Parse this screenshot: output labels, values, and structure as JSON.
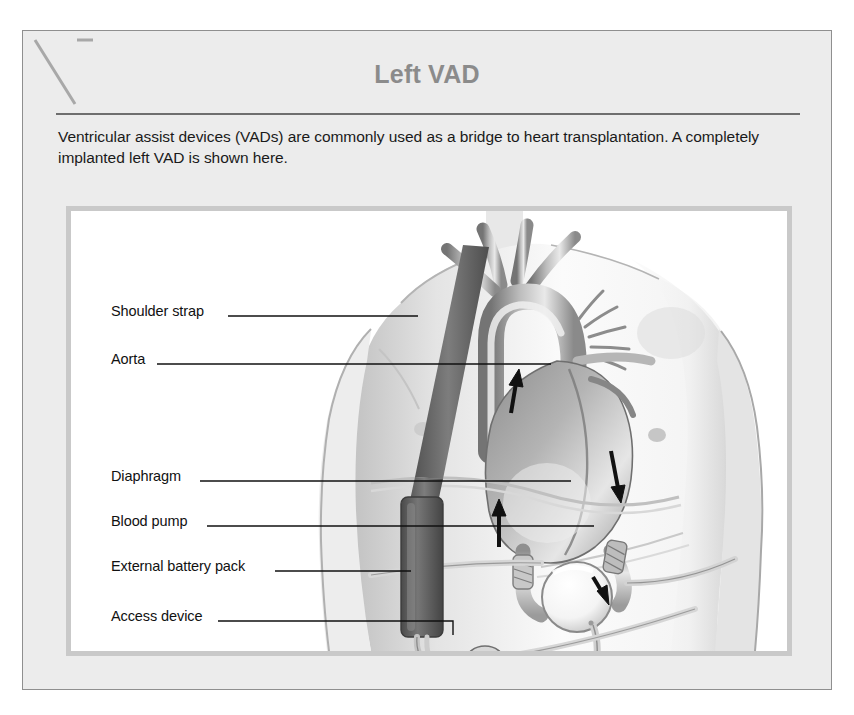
{
  "figure": {
    "title": "Left VAD",
    "caption": "Ventricular assist devices (VADs) are commonly used as a bridge to heart transplantation. A completely implanted left VAD is shown here.",
    "corner_mark": "diagonal-slash-mark"
  },
  "colors": {
    "card_background": "#ececec",
    "card_border": "#8f8f8f",
    "title_text": "#8b8b8b",
    "title_rule": "#6e6e6e",
    "caption_text": "#1a1a1a",
    "panel_background": "#ffffff",
    "panel_border": "#c9c9c9",
    "leader_line": "#111111",
    "label_text": "#111111",
    "strap_dark": "#6a6a6a",
    "battery_dark": "#5e5e5e",
    "skin_light": "#f3f3f3",
    "skin_shade": "#cfcfcf",
    "heart_mid": "#9a9a9a",
    "heart_dark": "#6d6d6d",
    "arrow_black": "#111111",
    "pump_white": "#fbfbfb",
    "tube_gray": "#b5b5b5"
  },
  "illustration": {
    "subject": "male-torso-anterior-view-with-implanted-left-ventricular-assist-device",
    "anatomy": [
      "aortic-arch",
      "brachiocephalic-branches",
      "ascending-aorta",
      "heart-left-ventricle",
      "pulmonary-artery",
      "diaphragm"
    ],
    "device_parts": [
      "shoulder-strap",
      "external-battery-pack",
      "blood-pump",
      "inflow-cannula",
      "outflow-cannula",
      "driveline",
      "access-device-port"
    ],
    "flow_arrows": [
      {
        "name": "inflow-arrow-lower",
        "direction": "up"
      },
      {
        "name": "inflow-arrow-upper",
        "direction": "up"
      },
      {
        "name": "outflow-arrow",
        "direction": "down"
      },
      {
        "name": "pump-arrow",
        "direction": "right-down"
      }
    ]
  },
  "callouts": [
    {
      "id": "shoulder-strap",
      "label": "Shoulder strap",
      "label_x": 88,
      "label_y": 280,
      "line": {
        "x1": 205,
        "y1": 285,
        "x2": 395,
        "y2": 285
      }
    },
    {
      "id": "aorta",
      "label": "Aorta",
      "label_x": 88,
      "label_y": 328,
      "line": {
        "x1": 134,
        "y1": 333,
        "x2": 528,
        "y2": 333
      }
    },
    {
      "id": "diaphragm",
      "label": "Diaphragm",
      "label_x": 88,
      "label_y": 445,
      "line": {
        "x1": 177,
        "y1": 450,
        "x2": 548,
        "y2": 450
      }
    },
    {
      "id": "blood-pump",
      "label": "Blood pump",
      "label_x": 88,
      "label_y": 490,
      "line": {
        "x1": 184,
        "y1": 495,
        "x2": 571,
        "y2": 495
      }
    },
    {
      "id": "external-battery-pack",
      "label": "External battery pack",
      "label_x": 88,
      "label_y": 535,
      "line": {
        "x1": 252,
        "y1": 540,
        "x2": 388,
        "y2": 540
      }
    },
    {
      "id": "access-device",
      "label": "Access device",
      "label_x": 88,
      "label_y": 585,
      "line": {
        "x1": 195,
        "y1": 590,
        "x2": 430,
        "y2": 590
      },
      "elbow": {
        "x": 430,
        "y1": 590,
        "y2": 604
      }
    }
  ]
}
